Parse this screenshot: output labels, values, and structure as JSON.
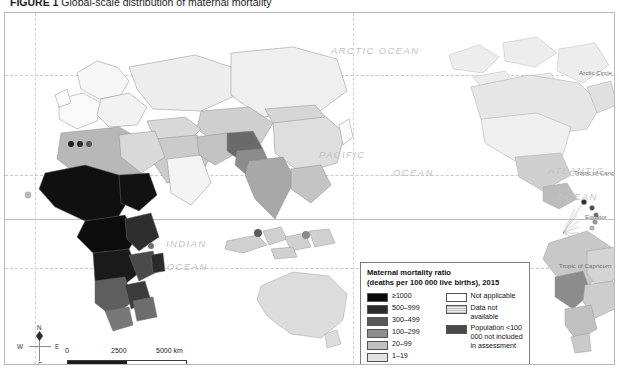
{
  "figure": {
    "number": "FIGURE 1",
    "caption": "Global-scale distribution of maternal mortality"
  },
  "legend": {
    "title_line1": "Maternal mortality ratio",
    "title_line2": "(deaths per 100 000 live births), 2015",
    "classes": [
      {
        "label": "≥1000",
        "color": "#0a0a0a"
      },
      {
        "label": "500–999",
        "color": "#2a2a2a"
      },
      {
        "label": "300–499",
        "color": "#585858"
      },
      {
        "label": "100–299",
        "color": "#8e8e8e"
      },
      {
        "label": "20–99",
        "color": "#c0c0c0"
      },
      {
        "label": "1–19",
        "color": "#e2e2e2"
      }
    ],
    "other": [
      {
        "label": "Not applicable",
        "color": "#ffffff",
        "style": "solid"
      },
      {
        "label": "Data not available",
        "color": "#dcdcdc",
        "style": "hatch"
      },
      {
        "label": "Population <100 000 not included in assessment",
        "color": "#4a4a4a",
        "style": "solid"
      }
    ]
  },
  "ocean_labels": [
    {
      "text": "ARCTIC OCEAN",
      "x": 330,
      "y": 40
    },
    {
      "text": "PACIFIC",
      "x": 318,
      "y": 144
    },
    {
      "text": "OCEAN",
      "x": 392,
      "y": 162
    },
    {
      "text": "INDIAN",
      "x": 165,
      "y": 233
    },
    {
      "text": "OCEAN",
      "x": 166,
      "y": 256
    },
    {
      "text": "ATLANTIC",
      "x": 547,
      "y": 160
    },
    {
      "text": "OCEAN",
      "x": 556,
      "y": 186
    }
  ],
  "graticule_labels": [
    {
      "text": "Arctic Circle",
      "x": 578,
      "y": 72
    },
    {
      "text": "Tropic of Cancer",
      "x": 573,
      "y": 172
    },
    {
      "text": "Equator",
      "x": 584,
      "y": 216
    },
    {
      "text": "Tropic of Capricorn",
      "x": 558,
      "y": 265
    }
  ],
  "compass": {
    "north": "N",
    "south": "S",
    "west": "W",
    "east": "E"
  },
  "scalebar": {
    "start": "0",
    "middle": "2500",
    "end": "5000 km"
  }
}
